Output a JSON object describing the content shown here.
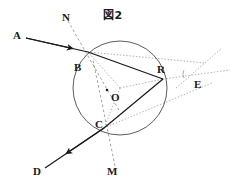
{
  "figure": {
    "title": "図2",
    "width": 237,
    "height": 184,
    "background_color": "#ffffff",
    "stroke_color": "#1a1a1a",
    "dashed_color": "#7a7a7a",
    "dotted_color": "#8c8c8c"
  },
  "circle": {
    "center_label": "O",
    "cx": 120,
    "cy": 88,
    "r": 47
  },
  "points": [
    {
      "name": "A",
      "label": "A",
      "x": 26,
      "y": 35,
      "label_x": 13,
      "label_y": 30,
      "on_circle": false
    },
    {
      "name": "B",
      "label": "B",
      "x": 88,
      "y": 52,
      "label_x": 74,
      "label_y": 62,
      "on_circle": true
    },
    {
      "name": "C",
      "label": "C",
      "x": 104,
      "y": 128,
      "label_x": 95,
      "label_y": 119,
      "on_circle": true
    },
    {
      "name": "D",
      "label": "D",
      "x": 45,
      "y": 168,
      "label_x": 33,
      "label_y": 166,
      "on_circle": false
    },
    {
      "name": "E",
      "label": "E",
      "x": 192,
      "y": 74,
      "label_x": 194,
      "label_y": 79,
      "on_circle": false
    },
    {
      "name": "M",
      "label": "M",
      "x": 115,
      "y": 170,
      "label_x": 107,
      "label_y": 166,
      "on_circle": false
    },
    {
      "name": "N",
      "label": "N",
      "x": 68,
      "y": 18,
      "label_x": 62,
      "label_y": 12,
      "on_circle": false
    },
    {
      "name": "O",
      "label": "O",
      "x": 120,
      "y": 88,
      "label_x": 115,
      "label_y": 93,
      "on_circle": false
    },
    {
      "name": "R",
      "label": "R",
      "x": 163,
      "y": 79,
      "label_x": 157,
      "label_y": 66,
      "on_circle": true
    }
  ],
  "solid_rays": [
    {
      "name": "ray-A-to-B",
      "x1": 26,
      "y1": 38,
      "x2": 88,
      "y2": 52,
      "arrow_at": 0.72
    },
    {
      "name": "chord-B-to-R",
      "x1": 88,
      "y1": 52,
      "x2": 163,
      "y2": 79,
      "arrow_at": null
    },
    {
      "name": "chord-R-to-C",
      "x1": 163,
      "y1": 79,
      "x2": 104,
      "y2": 128,
      "arrow_at": null
    },
    {
      "name": "ray-C-to-D",
      "x1": 104,
      "y1": 128,
      "x2": 45,
      "y2": 168,
      "arrow_at": 0.58
    }
  ],
  "dashed_lines": [
    {
      "name": "normal-N-through-B",
      "x1": 68,
      "y1": 21,
      "x2": 120,
      "y2": 112
    },
    {
      "name": "normal-M-through-C",
      "x1": 115,
      "y1": 166,
      "x2": 93,
      "y2": 60
    }
  ],
  "dotted_lines": [
    {
      "name": "radius-O-to-B",
      "x1": 120,
      "y1": 88,
      "x2": 88,
      "y2": 52
    },
    {
      "name": "radius-O-to-C",
      "x1": 120,
      "y1": 88,
      "x2": 104,
      "y2": 128
    },
    {
      "name": "radius-O-to-R",
      "x1": 120,
      "y1": 88,
      "x2": 163,
      "y2": 79
    },
    {
      "name": "secant-B-to-E",
      "x1": 88,
      "y1": 52,
      "x2": 206,
      "y2": 63
    },
    {
      "name": "secant-C-to-E",
      "x1": 104,
      "y1": 128,
      "x2": 212,
      "y2": 83
    },
    {
      "name": "line-R-to-E-extended",
      "x1": 163,
      "y1": 79,
      "x2": 230,
      "y2": 70
    },
    {
      "name": "line-through-E-upper-right",
      "x1": 176,
      "y1": 88,
      "x2": 222,
      "y2": 48
    }
  ],
  "angle_marks": [
    {
      "name": "angle-arc-at-E",
      "cx": 192,
      "cy": 74,
      "r": 9,
      "start_deg": 152,
      "end_deg": 205
    }
  ],
  "legend": {
    "solid_meaning": "light ray path",
    "dashed_meaning": "normal line",
    "dotted_meaning": "radius / construction line"
  }
}
